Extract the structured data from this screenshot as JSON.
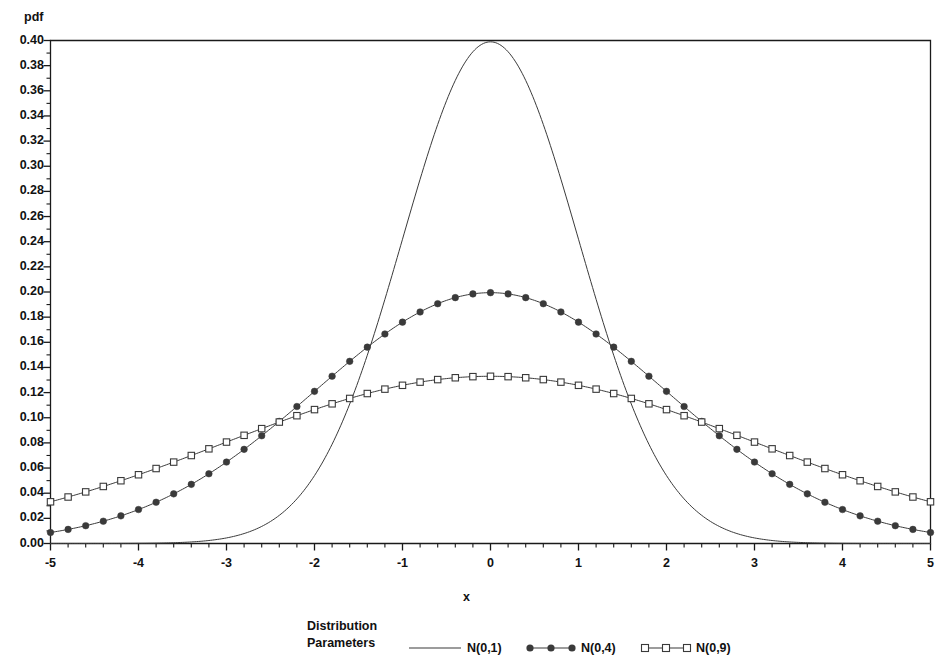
{
  "chart_data": {
    "type": "line",
    "title": "",
    "xlabel": "x",
    "ylabel": "pdf",
    "xlim": [
      -5,
      5
    ],
    "ylim": [
      0.0,
      0.4
    ],
    "xticks": [
      -5,
      -4,
      -3,
      -2,
      -1,
      0,
      1,
      2,
      3,
      4,
      5
    ],
    "xtick_labels": [
      "-5",
      "-4",
      "-3",
      "-2",
      "-1",
      "0",
      "1",
      "2",
      "3",
      "4",
      "5"
    ],
    "yticks": [
      0.0,
      0.02,
      0.04,
      0.06,
      0.08,
      0.1,
      0.12,
      0.14,
      0.16,
      0.18,
      0.2,
      0.22,
      0.24,
      0.26,
      0.28,
      0.3,
      0.32,
      0.34,
      0.36,
      0.38,
      0.4
    ],
    "ytick_labels": [
      "0.00",
      "0.02",
      "0.04",
      "0.06",
      "0.08",
      "0.10",
      "0.12",
      "0.14",
      "0.16",
      "0.18",
      "0.20",
      "0.22",
      "0.24",
      "0.26",
      "0.28",
      "0.30",
      "0.32",
      "0.34",
      "0.36",
      "0.38",
      "0.40"
    ],
    "x_minor_ticks_per_interval": 5,
    "y_minor_ticks_per_interval": 2,
    "grid": false,
    "legend_position": "bottom",
    "legend_title_lines": [
      "Distribution",
      "Parameters"
    ],
    "series": [
      {
        "name": "N(0,1)",
        "mu": 0,
        "sigma": 1,
        "marker": "none",
        "line_color": "#3a3a3a",
        "line_width": 1.0,
        "x": [
          -5,
          -4.5,
          -4,
          -3.5,
          -3,
          -2.5,
          -2,
          -1.5,
          -1,
          -0.5,
          0,
          0.5,
          1,
          1.5,
          2,
          2.5,
          3,
          3.5,
          4,
          4.5,
          5
        ],
        "y": [
          1.5e-06,
          1.6e-05,
          0.0001338,
          0.0008727,
          0.0044318,
          0.0175283,
          0.053991,
          0.1295176,
          0.2419707,
          0.3520653,
          0.3989423,
          0.3520653,
          0.2419707,
          0.1295176,
          0.053991,
          0.0175283,
          0.0044318,
          0.0008727,
          0.0001338,
          1.6e-05,
          1.5e-06
        ],
        "peak": 0.3989
      },
      {
        "name": "N(0,4)",
        "mu": 0,
        "sigma": 2,
        "marker": "filled-circle",
        "line_color": "#3a3a3a",
        "line_width": 1.0,
        "x": [
          -5,
          -4.5,
          -4,
          -3.5,
          -3,
          -2.5,
          -2,
          -1.5,
          -1,
          -0.5,
          0,
          0.5,
          1,
          1.5,
          2,
          2.5,
          3,
          3.5,
          4,
          4.5,
          5
        ],
        "y": [
          0.0129518,
          0.0228311,
          0.0269955,
          0.0455209,
          0.0647588,
          0.0876415,
          0.1209854,
          0.1505687,
          0.1760327,
          0.1933341,
          0.1994711,
          0.1933341,
          0.1760327,
          0.1505687,
          0.1209854,
          0.0876415,
          0.0647588,
          0.0455209,
          0.0269955,
          0.0228311,
          0.0129518
        ],
        "peak": 0.1995
      },
      {
        "name": "N(0,9)",
        "mu": 0,
        "sigma": 3,
        "marker": "open-square",
        "line_color": "#3a3a3a",
        "line_width": 1.0,
        "x": [
          -5,
          -4.5,
          -4,
          -3.5,
          -3,
          -2.5,
          -2,
          -1.5,
          -1,
          -0.5,
          0,
          0.5,
          1,
          1.5,
          2,
          2.5,
          3,
          3.5,
          4,
          4.5,
          5
        ],
        "y": [
          0.033159,
          0.044789,
          0.05467,
          0.06871,
          0.0806569,
          0.0965323,
          0.1064827,
          0.1157334,
          0.1257944,
          0.1312542,
          0.1329808,
          0.1312542,
          0.1257944,
          0.1157334,
          0.1064827,
          0.0965323,
          0.0806569,
          0.06871,
          0.05467,
          0.044789,
          0.033159
        ],
        "peak": 0.133
      }
    ]
  },
  "axes": {
    "y_title": "pdf",
    "x_title": "x"
  },
  "legend": {
    "title_line1": "Distribution",
    "title_line2": "Parameters",
    "entries": [
      {
        "label": "N(0,1)",
        "marker": "none"
      },
      {
        "label": "N(0,4)",
        "marker": "filled-circle"
      },
      {
        "label": "N(0,9)",
        "marker": "open-square"
      }
    ]
  },
  "colors": {
    "line": "#3a3a3a",
    "axis": "#1a1a1a",
    "text": "#111111",
    "background": "#ffffff"
  }
}
